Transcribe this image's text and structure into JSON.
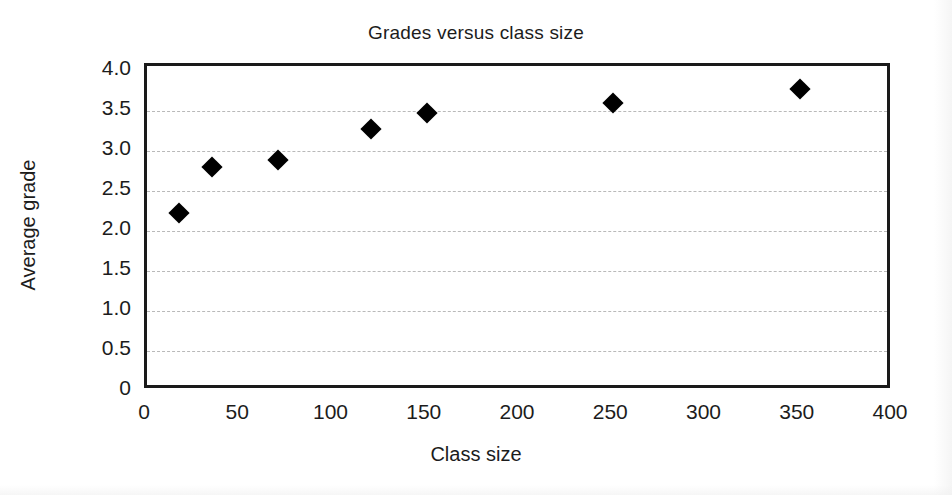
{
  "chart_data": {
    "type": "scatter",
    "title": "Grades versus class size",
    "xlabel": "Class size",
    "ylabel": "Average grade",
    "xlim": [
      0,
      400
    ],
    "ylim": [
      0,
      4.0
    ],
    "xticks": [
      "0",
      "50",
      "100",
      "150",
      "200",
      "250",
      "300",
      "350",
      "400"
    ],
    "xtick_values": [
      0,
      50,
      100,
      150,
      200,
      250,
      300,
      350,
      400
    ],
    "yticks": [
      "0",
      "0.5",
      "1.0",
      "1.5",
      "2.0",
      "2.5",
      "3.0",
      "3.5",
      "4.0"
    ],
    "ytick_values": [
      0,
      0.5,
      1.0,
      1.5,
      2.0,
      2.5,
      3.0,
      3.5,
      4.0
    ],
    "grid": "horizontal-dashed",
    "legend": null,
    "marker": "filled-diamond",
    "marker_color": "#000000",
    "series": [
      {
        "name": "Average grade by class size",
        "x": [
          17,
          35,
          70,
          120,
          150,
          250,
          350
        ],
        "y": [
          2.22,
          2.8,
          2.89,
          3.27,
          3.48,
          3.6,
          3.77
        ]
      }
    ],
    "points": [
      {
        "x": 17,
        "y": 2.22
      },
      {
        "x": 35,
        "y": 2.8
      },
      {
        "x": 70,
        "y": 2.89
      },
      {
        "x": 120,
        "y": 3.27
      },
      {
        "x": 150,
        "y": 3.48
      },
      {
        "x": 250,
        "y": 3.6
      },
      {
        "x": 350,
        "y": 3.77
      }
    ]
  },
  "colors": {
    "axis": "#1a1a1a",
    "grid": "#b9b9b9",
    "marker": "#000000",
    "text": "#1c1c1c",
    "background": "#ffffff"
  }
}
